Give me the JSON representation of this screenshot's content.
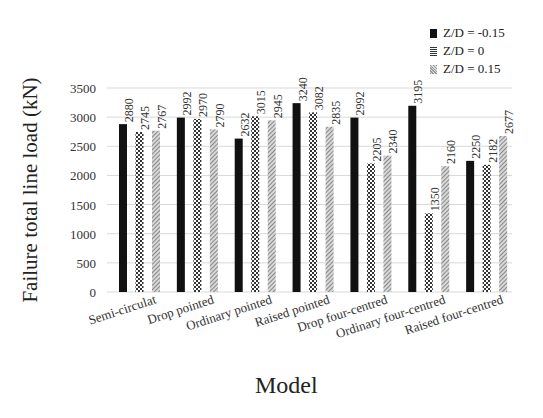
{
  "chart_data": {
    "type": "bar",
    "title": "",
    "xlabel": "Model",
    "ylabel": "Failure total line load (kN)",
    "ylim": [
      0,
      3500
    ],
    "yticks": [
      0,
      500,
      1000,
      1500,
      2000,
      2500,
      3000,
      3500
    ],
    "grid": true,
    "legend_position": "top-right",
    "categories": [
      "Semi-circulat",
      "Drop pointed",
      "Ordinary pointed",
      "Raised pointed",
      "Drop four-centred",
      "Ordinary four-centred",
      "Raised four-centred"
    ],
    "series": [
      {
        "name": "Z/D = -0.15",
        "pattern": "solid-black",
        "values": [
          2880,
          2992,
          2632,
          3240,
          2992,
          3195,
          2250
        ]
      },
      {
        "name": "Z/D = 0",
        "pattern": "checker",
        "values": [
          2745,
          2970,
          3015,
          3082,
          2205,
          1350,
          2182
        ]
      },
      {
        "name": "Z/D = 0.15",
        "pattern": "light-hatch",
        "values": [
          2767,
          2790,
          2945,
          2835,
          2340,
          2160,
          2677
        ]
      }
    ]
  },
  "legend": [
    {
      "label": "Z/D = -0.15",
      "color": "#111111"
    },
    {
      "label": "Z/D = 0",
      "color": "#777777"
    },
    {
      "label": "Z/D = 0.15",
      "color": "#bbbbbb"
    }
  ]
}
